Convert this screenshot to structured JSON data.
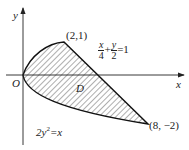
{
  "axes": {
    "x_label": "x",
    "y_label": "y",
    "origin_label": "O"
  },
  "points": [
    {
      "label": "(2,1)",
      "x": 2,
      "y": 1
    },
    {
      "label": "(8, −2)",
      "x": 8,
      "y": -2
    }
  ],
  "curves": {
    "line": {
      "num_x": "x",
      "den_x": "4",
      "plus": "+",
      "num_y": "y",
      "den_y": "2",
      "rhs": "=1"
    },
    "parabola": {
      "lhs": "2y",
      "exp": "2",
      "rhs": "=x"
    }
  },
  "region_label": "D"
}
